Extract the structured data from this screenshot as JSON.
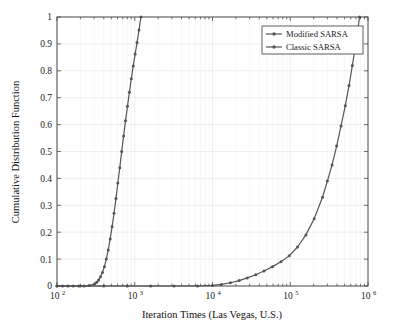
{
  "chart_data": {
    "type": "line",
    "title": "",
    "xlabel": "Iteration Times (Las Vegas, U.S.)",
    "ylabel": "Cumulative Distribution Function",
    "xscale": "log",
    "yscale": "linear",
    "xlim": [
      100,
      1000000
    ],
    "ylim": [
      0,
      1
    ],
    "grid": true,
    "legend_position": "top-right",
    "xtick_labels": [
      "10^2",
      "10^3",
      "10^4",
      "10^5",
      "10^6"
    ],
    "xtick_mantissa": [
      "10",
      "10",
      "10",
      "10",
      "10"
    ],
    "xtick_exponents": [
      "2",
      "3",
      "4",
      "5",
      "6"
    ],
    "xtick_values": [
      100,
      1000,
      10000,
      100000,
      1000000
    ],
    "ytick_labels": [
      "0",
      "0.1",
      "0.2",
      "0.3",
      "0.4",
      "0.5",
      "0.6",
      "0.7",
      "0.8",
      "0.9",
      "1"
    ],
    "ytick_values": [
      0,
      0.1,
      0.2,
      0.3,
      0.4,
      0.5,
      0.6,
      0.7,
      0.8,
      0.9,
      1
    ],
    "line_color": "#555555",
    "marker_color": "#555555",
    "grid_color": "#e8e8e8",
    "axis_color": "#4d4d4d",
    "series": [
      {
        "name": "Modified SARSA",
        "marker": "circle",
        "x": [
          100,
          118,
          138,
          162,
          190,
          223,
          261,
          306,
          324,
          343,
          363,
          384,
          407,
          431,
          456,
          483,
          511,
          541,
          573,
          606,
          642,
          679,
          719,
          761,
          806,
          853,
          903,
          956,
          1012,
          1071,
          1134,
          1200
        ],
        "y": [
          0,
          0,
          0,
          0,
          0,
          0,
          0.002,
          0.008,
          0.014,
          0.022,
          0.034,
          0.05,
          0.072,
          0.1,
          0.134,
          0.175,
          0.22,
          0.27,
          0.325,
          0.383,
          0.44,
          0.5,
          0.558,
          0.614,
          0.668,
          0.72,
          0.77,
          0.818,
          0.862,
          0.905,
          0.952,
          1.0
        ]
      },
      {
        "name": "Classic SARSA",
        "marker": "square",
        "x": [
          100,
          200,
          400,
          800,
          1600,
          3200,
          6400,
          10000,
          13000,
          17000,
          22000,
          28000,
          36000,
          46000,
          59000,
          76000,
          97000,
          124000,
          159000,
          203000,
          260000,
          300000,
          345000,
          395000,
          450000,
          510000,
          570000,
          630000,
          690000,
          740000,
          780000
        ],
        "y": [
          0,
          0,
          0,
          0,
          0,
          0,
          0,
          0.002,
          0.006,
          0.012,
          0.02,
          0.03,
          0.042,
          0.056,
          0.072,
          0.09,
          0.112,
          0.145,
          0.19,
          0.25,
          0.33,
          0.39,
          0.45,
          0.52,
          0.595,
          0.67,
          0.745,
          0.82,
          0.895,
          0.955,
          1.0
        ]
      }
    ]
  },
  "legend": {
    "items": [
      {
        "label": "Modified SARSA"
      },
      {
        "label": "Classic SARSA"
      }
    ]
  }
}
